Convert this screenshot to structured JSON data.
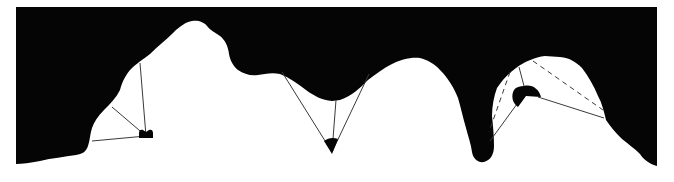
{
  "diagram": {
    "colors": {
      "background": "#ffffff",
      "silhouette": "#050505",
      "sight_line": "#3a3a3a"
    },
    "profiles": [
      {
        "id": "left-alcove",
        "viewpoint": {
          "x": 146,
          "y": 136,
          "shape": "half-disc"
        },
        "sight_lines": [
          {
            "x1": 146,
            "y1": 136,
            "x2": 92,
            "y2": 141,
            "style": "solid"
          },
          {
            "x1": 146,
            "y1": 136,
            "x2": 112,
            "y2": 107,
            "style": "solid"
          },
          {
            "x1": 146,
            "y1": 136,
            "x2": 140,
            "y2": 63,
            "style": "solid"
          }
        ]
      },
      {
        "id": "middle-valley",
        "viewpoint": {
          "x": 332,
          "y": 148,
          "shape": "sector-down"
        },
        "sight_lines": [
          {
            "x1": 332,
            "y1": 152,
            "x2": 282,
            "y2": 72,
            "style": "solid"
          },
          {
            "x1": 332,
            "y1": 152,
            "x2": 336,
            "y2": 100,
            "style": "solid"
          },
          {
            "x1": 332,
            "y1": 152,
            "x2": 369,
            "y2": 74,
            "style": "solid"
          }
        ]
      },
      {
        "id": "right-overhang",
        "viewpoint": {
          "x": 527,
          "y": 95,
          "shape": "disc-sector"
        },
        "sight_lines": [
          {
            "x1": 519,
            "y1": 104,
            "x2": 491,
            "y2": 141,
            "style": "solid"
          },
          {
            "x1": 538,
            "y1": 97,
            "x2": 604,
            "y2": 118,
            "style": "solid"
          },
          {
            "x1": 524,
            "y1": 86,
            "x2": 519,
            "y2": 68,
            "style": "solid"
          },
          {
            "x1": 509,
            "y1": 72,
            "x2": 489,
            "y2": 130,
            "style": "dashed"
          },
          {
            "x1": 533,
            "y1": 60,
            "x2": 603,
            "y2": 110,
            "style": "dashed"
          }
        ]
      }
    ]
  }
}
